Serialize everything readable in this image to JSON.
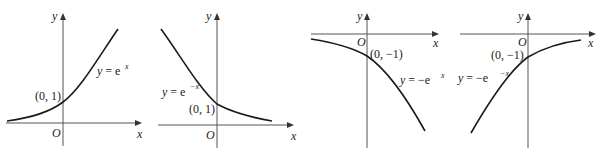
{
  "figures": [
    {
      "id": "exp",
      "equation": {
        "prefix": "y = e",
        "exponent": "x"
      },
      "point_label": "(0, 1)",
      "origin_label": "O",
      "x_axis_label": "x",
      "y_axis_label": "y"
    },
    {
      "id": "exp-neg",
      "equation": {
        "prefix": "y = e",
        "exponent": "−x"
      },
      "point_label": "(0, 1)",
      "origin_label": "O",
      "x_axis_label": "x",
      "y_axis_label": "y"
    },
    {
      "id": "neg-exp",
      "equation": {
        "prefix": "y = −e",
        "exponent": "x"
      },
      "point_label": "(0, −1)",
      "origin_label": "O",
      "x_axis_label": "x",
      "y_axis_label": "y"
    },
    {
      "id": "neg-exp-neg",
      "equation": {
        "prefix": "y = −e",
        "exponent": "−x"
      },
      "point_label": "(0, −1)",
      "origin_label": "O",
      "x_axis_label": "x",
      "y_axis_label": "y"
    }
  ]
}
